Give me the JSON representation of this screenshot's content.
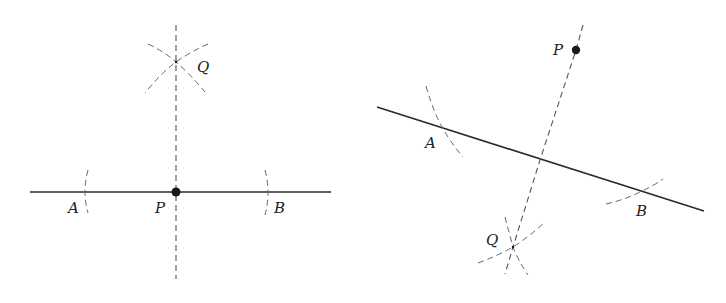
{
  "figures": [
    {
      "name": "perpendicular-at-point-on-line",
      "labels": {
        "A": "A",
        "B": "B",
        "P": "P",
        "Q": "Q"
      }
    },
    {
      "name": "perpendicular-from-point-off-line",
      "labels": {
        "A": "A",
        "B": "B",
        "P": "P",
        "Q": "Q"
      }
    }
  ],
  "colors": {
    "line": "#2a2a2a",
    "construction": "#555555",
    "point": "#1a1a1a",
    "background": "#ffffff"
  }
}
